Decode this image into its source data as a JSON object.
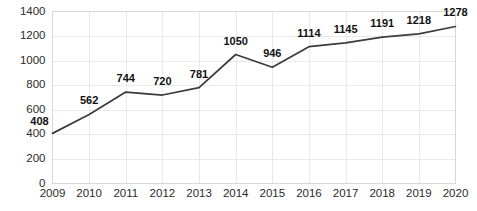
{
  "chart_data": {
    "type": "line",
    "title": "",
    "subtitle": "",
    "xlabel": "",
    "ylabel": "",
    "categories": [
      "2009",
      "2010",
      "2011",
      "2012",
      "2013",
      "2014",
      "2015",
      "2016",
      "2017",
      "2018",
      "2019",
      "2020"
    ],
    "values": [
      408,
      562,
      744,
      720,
      781,
      1050,
      946,
      1114,
      1145,
      1191,
      1218,
      1278
    ],
    "series": [
      {
        "name": "",
        "values": [
          408,
          562,
          744,
          720,
          781,
          1050,
          946,
          1114,
          1145,
          1191,
          1218,
          1278
        ]
      }
    ],
    "data_labels": [
      "408",
      "562",
      "744",
      "720",
      "781",
      "1050",
      "946",
      "1114",
      "1145",
      "1191",
      "1218",
      "1278"
    ],
    "ylim": [
      0,
      1400
    ],
    "ytick_step": 200,
    "ytick_labels": [
      "0",
      "200",
      "400",
      "600",
      "800",
      "1000",
      "1200",
      "1400"
    ],
    "ytick_values": [
      0,
      200,
      400,
      600,
      800,
      1000,
      1200,
      1400
    ],
    "xtick_labels": [
      "2009",
      "2010",
      "2011",
      "2012",
      "2013",
      "2014",
      "2015",
      "2016",
      "2017",
      "2018",
      "2019",
      "2020"
    ],
    "grid": {
      "horizontal": true,
      "vertical": true,
      "color": "#e9e9e9"
    },
    "legend": {
      "visible": false,
      "position": "none",
      "entries": []
    },
    "colors": {
      "line": "#3b3b3b",
      "axis": "#d8d8d8",
      "grid": "#e9e9e9",
      "tick_text": "#2b2b2b",
      "label_text": "#111111",
      "background": "#ffffff"
    },
    "label_offsets_px": [
      {
        "dx": -13,
        "dy": -8
      },
      {
        "dx": 0,
        "dy": -10
      },
      {
        "dx": 0,
        "dy": -10
      },
      {
        "dx": 0,
        "dy": -10
      },
      {
        "dx": 0,
        "dy": -10
      },
      {
        "dx": 0,
        "dy": -10
      },
      {
        "dx": 0,
        "dy": -10
      },
      {
        "dx": 0,
        "dy": -10
      },
      {
        "dx": 0,
        "dy": -10
      },
      {
        "dx": 0,
        "dy": -10
      },
      {
        "dx": 0,
        "dy": -10
      },
      {
        "dx": 0,
        "dy": -10
      }
    ]
  }
}
